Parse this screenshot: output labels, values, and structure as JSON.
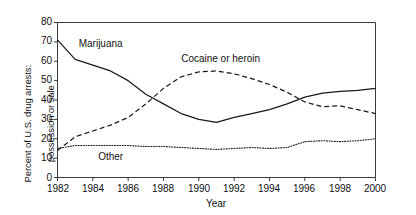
{
  "chart_data": {
    "type": "line",
    "title": "",
    "xlabel": "Year",
    "ylabel": "Percent of U.S. drug arrests: possession or sale",
    "ylabel_line1": "Percent of U.S. drug arrests:",
    "ylabel_line2": "possession or sale",
    "xlim": [
      1982,
      2000
    ],
    "ylim": [
      0,
      80
    ],
    "yticks": [
      0,
      10,
      20,
      30,
      40,
      50,
      60,
      70,
      80
    ],
    "xticks": [
      1982,
      1984,
      1986,
      1988,
      1990,
      1992,
      1994,
      1996,
      1998,
      2000
    ],
    "grid": false,
    "legend": "inline-annotations",
    "x": [
      1982,
      1983,
      1984,
      1985,
      1986,
      1987,
      1988,
      1989,
      1990,
      1991,
      1992,
      1993,
      1994,
      1995,
      1996,
      1997,
      1998,
      1999,
      2000
    ],
    "series": [
      {
        "name": "Marijuana",
        "style": "solid",
        "color": "#1a1a1a",
        "label_x": 1983.2,
        "label_y": 69,
        "values": [
          71,
          61,
          58,
          55,
          50,
          43,
          38,
          33,
          30,
          28.5,
          31,
          33,
          35,
          38,
          41.5,
          43.5,
          44.5,
          45,
          46
        ]
      },
      {
        "name": "Cocaine or heroin",
        "style": "dashed",
        "color": "#1a1a1a",
        "label_x": 1989.0,
        "label_y": 61,
        "values": [
          14,
          21,
          24,
          27,
          31,
          38,
          46,
          52,
          54.5,
          55,
          53.5,
          51,
          48,
          44,
          39,
          36.5,
          37,
          35,
          33
        ]
      },
      {
        "name": "Other",
        "style": "dotted",
        "color": "#1a1a1a",
        "label_x": 1984.3,
        "label_y": 10.5,
        "values": [
          15,
          16.5,
          16.5,
          16.5,
          16.5,
          16,
          16,
          15.5,
          15,
          14.5,
          15,
          15.5,
          15,
          15.5,
          18.5,
          19,
          18.5,
          19,
          20
        ]
      }
    ]
  },
  "axis": {
    "yticks": [
      "0",
      "10",
      "20",
      "30",
      "40",
      "50",
      "60",
      "70",
      "80"
    ],
    "xticks": [
      "1982",
      "1984",
      "1986",
      "1988",
      "1990",
      "1992",
      "1994",
      "1996",
      "1998",
      "2000"
    ],
    "xlabel": "Year",
    "ylabel_line1": "Percent of U.S. drug arrests:",
    "ylabel_line2": "possession or sale"
  },
  "annotations": {
    "marijuana": "Marijuana",
    "cocaine": "Cocaine or heroin",
    "other": "Other"
  }
}
